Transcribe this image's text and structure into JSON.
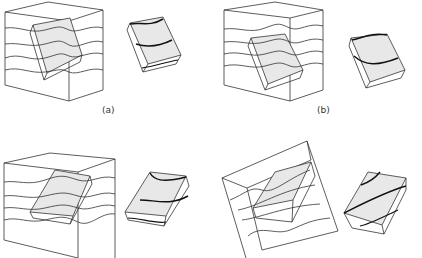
{
  "figure": {
    "panels": [
      {
        "id": "a",
        "label": "(a)",
        "description": "Layered block with embedded tilted sample and extracted sample"
      },
      {
        "id": "b",
        "label": "(b)",
        "description": "Layered block with embedded tilted sample and extracted sample"
      },
      {
        "id": "c",
        "label": "",
        "description": "Layered block with embedded tilted sample and extracted sample"
      },
      {
        "id": "d",
        "label": "",
        "description": "Rotated layered block with embedded sample and extracted sample"
      }
    ],
    "colors": {
      "line": "#333333",
      "sample_fill": "#e8e8e8",
      "bold_line": "#111111"
    }
  }
}
